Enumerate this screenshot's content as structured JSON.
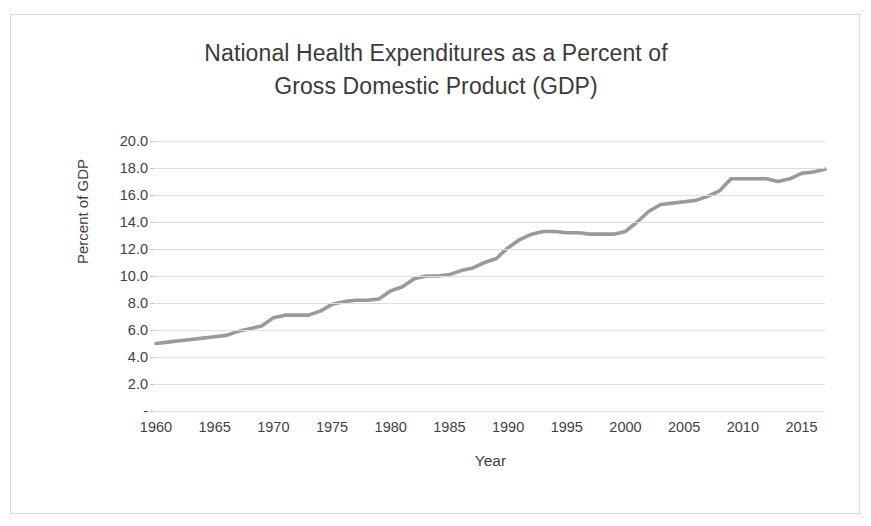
{
  "chart": {
    "title_line1": "National Health Expenditures as a Percent of",
    "title_line2": "Gross Domestic Product (GDP)",
    "xlabel": "Year",
    "ylabel": "Percent of GDP",
    "zero_tick_label": "-",
    "line_color": "#9a9a9a",
    "grid_color": "#dedede",
    "text_color": "#3f3f3f",
    "border_color": "#d9d9d9"
  },
  "chart_data": {
    "type": "line",
    "title": "National Health Expenditures as a Percent of Gross Domestic Product (GDP)",
    "xlabel": "Year",
    "ylabel": "Percent of GDP",
    "xlim": [
      1960,
      2017
    ],
    "ylim": [
      0,
      20
    ],
    "grid": true,
    "legend": "none",
    "ytick_labels": [
      "20.0",
      "18.0",
      "16.0",
      "14.0",
      "12.0",
      "10.0",
      "8.0",
      "6.0",
      "4.0",
      "2.0",
      "-"
    ],
    "ytick_values": [
      20,
      18,
      16,
      14,
      12,
      10,
      8,
      6,
      4,
      2,
      0
    ],
    "xtick_labels": [
      "1960",
      "1965",
      "1970",
      "1975",
      "1980",
      "1985",
      "1990",
      "1995",
      "2000",
      "2005",
      "2010",
      "2015"
    ],
    "xtick_values": [
      1960,
      1965,
      1970,
      1975,
      1980,
      1985,
      1990,
      1995,
      2000,
      2005,
      2010,
      2015
    ],
    "x": [
      1960,
      1961,
      1962,
      1963,
      1964,
      1965,
      1966,
      1967,
      1968,
      1969,
      1970,
      1971,
      1972,
      1973,
      1974,
      1975,
      1976,
      1977,
      1978,
      1979,
      1980,
      1981,
      1982,
      1983,
      1984,
      1985,
      1986,
      1987,
      1988,
      1989,
      1990,
      1991,
      1992,
      1993,
      1994,
      1995,
      1996,
      1997,
      1998,
      1999,
      2000,
      2001,
      2002,
      2003,
      2004,
      2005,
      2006,
      2007,
      2008,
      2009,
      2010,
      2011,
      2012,
      2013,
      2014,
      2015,
      2016,
      2017
    ],
    "values": [
      5.0,
      5.1,
      5.2,
      5.3,
      5.4,
      5.5,
      5.6,
      5.9,
      6.1,
      6.3,
      6.9,
      7.1,
      7.1,
      7.1,
      7.4,
      7.9,
      8.1,
      8.2,
      8.2,
      8.3,
      8.9,
      9.2,
      9.8,
      10.0,
      10.0,
      10.1,
      10.4,
      10.6,
      11.0,
      11.3,
      12.1,
      12.7,
      13.1,
      13.3,
      13.3,
      13.2,
      13.2,
      13.1,
      13.1,
      13.1,
      13.3,
      14.0,
      14.8,
      15.3,
      15.4,
      15.5,
      15.6,
      15.9,
      16.3,
      17.2,
      17.2,
      17.2,
      17.2,
      17.0,
      17.2,
      17.6,
      17.7,
      17.9
    ]
  }
}
